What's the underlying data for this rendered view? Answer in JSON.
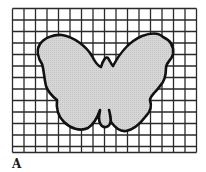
{
  "figure": {
    "panel_label": "A",
    "grid": {
      "x": 12.5,
      "y": 8.5,
      "cols": 16,
      "rows": 12.5,
      "cell": 11.5,
      "line_color": "#2a2a2a"
    },
    "shape": {
      "name": "butterfly",
      "fill": "#d4d4d4",
      "stroke": "#111111"
    }
  }
}
